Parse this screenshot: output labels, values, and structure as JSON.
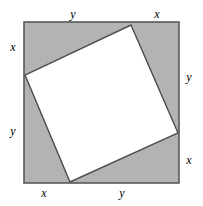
{
  "figure": {
    "name": "inscribed-tilted-square-diagram",
    "colors": {
      "shaded_triangle_fill": "#b3b3b3",
      "inner_square_fill": "#ffffff",
      "stroke": "#4d4d4d",
      "outer_stroke": "#595959",
      "background": "#ffffff",
      "label_color": "#000000"
    },
    "outer_square": {
      "left": 24,
      "top": 22,
      "right": 179,
      "bottom": 183
    },
    "inner_square_vertices": [
      {
        "name": "top-vertex",
        "x": 131,
        "y": 25
      },
      {
        "name": "right-vertex",
        "x": 178,
        "y": 133
      },
      {
        "name": "bottom-vertex",
        "x": 70,
        "y": 182
      },
      {
        "name": "left-vertex",
        "x": 25,
        "y": 75
      }
    ]
  },
  "labels": [
    {
      "id": "top-left-segment",
      "text": "y",
      "x": 73,
      "y": 14
    },
    {
      "id": "top-right-segment",
      "text": "x",
      "x": 157,
      "y": 14
    },
    {
      "id": "left-upper-segment",
      "text": "x",
      "x": 13,
      "y": 47
    },
    {
      "id": "left-lower-segment",
      "text": "y",
      "x": 13,
      "y": 131
    },
    {
      "id": "right-upper-segment",
      "text": "y",
      "x": 189,
      "y": 77
    },
    {
      "id": "right-lower-segment",
      "text": "x",
      "x": 189,
      "y": 160
    },
    {
      "id": "bottom-left-segment",
      "text": "x",
      "x": 44,
      "y": 193
    },
    {
      "id": "bottom-right-segment",
      "text": "y",
      "x": 122,
      "y": 193
    }
  ]
}
